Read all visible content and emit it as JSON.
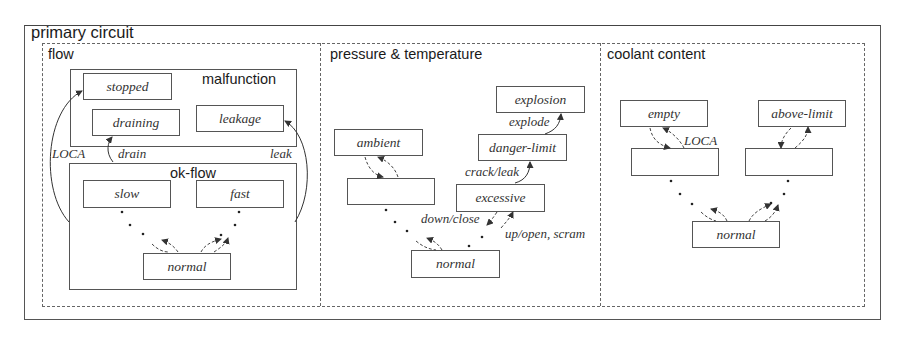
{
  "diagram": {
    "title": "primary circuit",
    "regions": {
      "flow": {
        "label": "flow",
        "malfunction": {
          "label": "malfunction",
          "states": {
            "stopped": "stopped",
            "draining": "draining",
            "leakage": "leakage"
          }
        },
        "ok_flow": {
          "label": "ok-flow",
          "states": {
            "slow": "slow",
            "fast": "fast",
            "normal": "normal"
          }
        },
        "transitions": {
          "loca": "LOCA",
          "drain": "drain",
          "leak": "leak"
        }
      },
      "pressure_temperature": {
        "label": "pressure & temperature",
        "states": {
          "explosion": "explosion",
          "danger_limit": "danger-limit",
          "ambient": "ambient",
          "unnamed": "",
          "excessive": "excessive",
          "normal": "normal"
        },
        "transitions": {
          "explode": "explode",
          "crack_leak": "crack/leak",
          "down_close": "down/close",
          "up_open_scram": "up/open, scram"
        }
      },
      "coolant_content": {
        "label": "coolant content",
        "states": {
          "empty": "empty",
          "above_limit": "above-limit",
          "unnamed_left": "",
          "unnamed_right": "",
          "normal": "normal"
        },
        "transitions": {
          "loca": "LOCA"
        }
      }
    }
  }
}
